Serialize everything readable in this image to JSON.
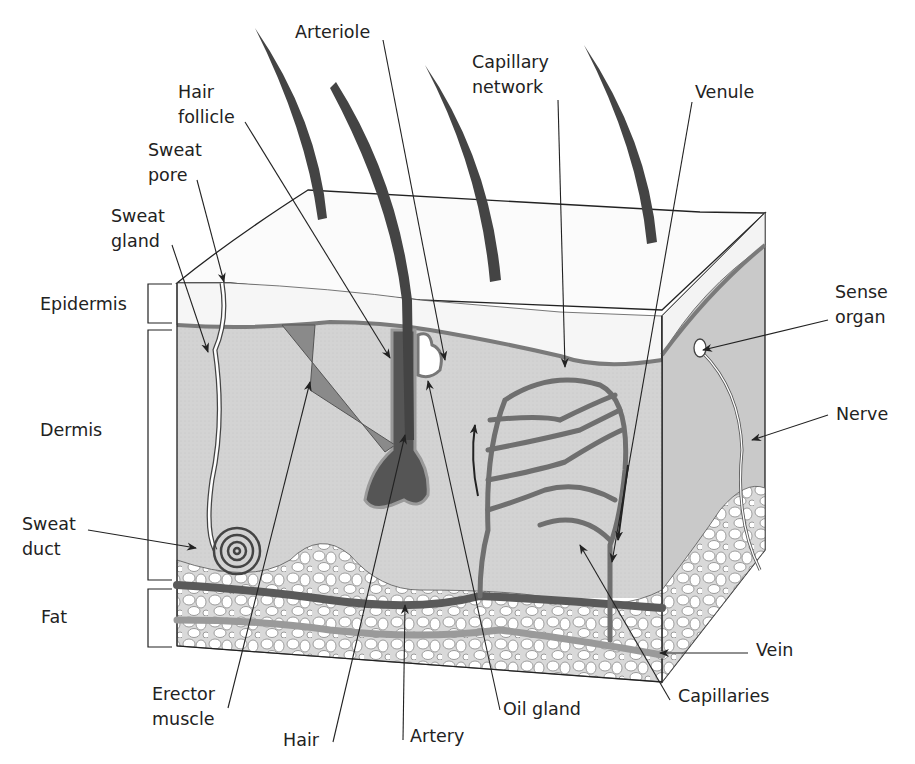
{
  "diagram": {
    "colors": {
      "background": "#ffffff",
      "epidermis": "#f6f6f6",
      "dermis": "#d4d4d4",
      "dermis_side": "#c6c6c6",
      "basement_line": "#7a7a7a",
      "hair": "#444444",
      "artery": "#5a5a5a",
      "vein": "#9a9a9a",
      "fat_cells": "#ffffff",
      "outline": "#222222"
    },
    "layers": [
      {
        "name": "Epidermis",
        "label": "Epidermis"
      },
      {
        "name": "Dermis",
        "label": "Dermis"
      },
      {
        "name": "Fat",
        "label": "Fat"
      }
    ],
    "labels": {
      "arteriole": "Arteriole",
      "hair_follicle": "Hair\nfollicle",
      "sweat_pore": "Sweat\npore",
      "sweat_gland": "Sweat\ngland",
      "epidermis": "Epidermis",
      "dermis": "Dermis",
      "sweat_duct": "Sweat\nduct",
      "fat": "Fat",
      "capillary_network": "Capillary\nnetwork",
      "venule": "Venule",
      "sense_organ": "Sense\norgan",
      "nerve": "Nerve",
      "vein": "Vein",
      "capillaries": "Capillaries",
      "oil_gland": "Oil gland",
      "artery": "Artery",
      "hair": "Hair",
      "erector_muscle": "Erector\nmuscle"
    }
  }
}
